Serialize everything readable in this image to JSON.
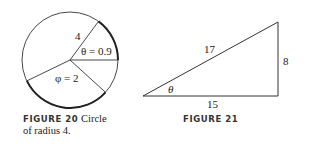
{
  "figure20": {
    "label": "FIGURE 20",
    "caption_line1": "Circle",
    "caption_line2": "of radius 4.",
    "radius_label": "4",
    "theta_label": "θ = 0.9",
    "phi_label": "φ = 2"
  },
  "figure21": {
    "label": "FIGURE 21",
    "hypotenuse_label": "17",
    "opposite_label": "8",
    "adjacent_label": "15",
    "angle_label": "θ"
  }
}
